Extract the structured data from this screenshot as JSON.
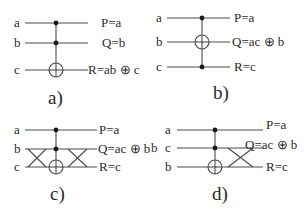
{
  "panels": {
    "a": {
      "caption": "a)",
      "inputs": [
        "a",
        "b",
        "c"
      ],
      "outputs": [
        "P=a",
        "Q=b",
        "R=ab ⊕ c"
      ],
      "gate": "Toffoli (controls a,b; target c)"
    },
    "b": {
      "caption": "b)",
      "inputs": [
        "a",
        "b",
        "c"
      ],
      "outputs": [
        "P=a",
        "Q=ac ⊕ b",
        "R=c"
      ],
      "gate": "Toffoli (controls a,c; target b)"
    },
    "c": {
      "caption": "c)",
      "inputs": [
        "a",
        "b",
        "c"
      ],
      "outputs": [
        "P=a",
        "Q=ac ⊕ b",
        "R=c"
      ],
      "gate": "Swap b/c, Toffoli, swap b/c"
    },
    "d": {
      "caption": "d)",
      "inputs": [
        "a",
        "c",
        "b"
      ],
      "extra_label": "b",
      "outputs": [
        "P=a",
        "Q=ac ⊕ b",
        "R=c"
      ],
      "gate": "Toffoli then swap"
    }
  },
  "colors": {
    "wire": "#4a4a4a",
    "text": "#2a2a2a",
    "background": "#ffffff"
  }
}
